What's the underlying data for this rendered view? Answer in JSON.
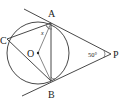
{
  "diagram": {
    "type": "geometry",
    "points": {
      "A": "A",
      "B": "B",
      "C": "C",
      "O": "O",
      "P": "P"
    },
    "angle_label": "50°",
    "unknown_label": "x",
    "colors": {
      "stroke": "#333333",
      "background": "#ffffff"
    }
  }
}
